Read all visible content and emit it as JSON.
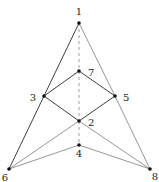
{
  "diagram": {
    "type": "graph",
    "nodes": [
      {
        "id": "1",
        "label": "1",
        "x": 79,
        "y": 23,
        "lx": 79,
        "ly": 15,
        "anchor": "middle"
      },
      {
        "id": "7",
        "label": "7",
        "x": 79,
        "y": 71,
        "lx": 88,
        "ly": 76,
        "anchor": "start"
      },
      {
        "id": "3",
        "label": "3",
        "x": 44,
        "y": 96,
        "lx": 36,
        "ly": 101,
        "anchor": "end"
      },
      {
        "id": "5",
        "label": "5",
        "x": 115,
        "y": 96,
        "lx": 123,
        "ly": 101,
        "anchor": "start"
      },
      {
        "id": "2",
        "label": "2",
        "x": 79,
        "y": 121,
        "lx": 88,
        "ly": 126,
        "anchor": "start"
      },
      {
        "id": "4",
        "label": "4",
        "x": 79,
        "y": 145,
        "lx": 79,
        "ly": 157,
        "anchor": "middle"
      },
      {
        "id": "6",
        "label": "6",
        "x": 9,
        "y": 169,
        "lx": 5,
        "ly": 181,
        "anchor": "middle"
      },
      {
        "id": "8",
        "label": "8",
        "x": 150,
        "y": 169,
        "lx": 155,
        "ly": 180,
        "anchor": "middle"
      }
    ],
    "edges": [
      {
        "from": "1",
        "to": "3",
        "style": "solid"
      },
      {
        "from": "3",
        "to": "6",
        "style": "solid"
      },
      {
        "from": "1",
        "to": "5",
        "style": "light"
      },
      {
        "from": "5",
        "to": "8",
        "style": "light"
      },
      {
        "from": "3",
        "to": "7",
        "style": "solid"
      },
      {
        "from": "7",
        "to": "5",
        "style": "solid"
      },
      {
        "from": "3",
        "to": "2",
        "style": "solid"
      },
      {
        "from": "2",
        "to": "8",
        "style": "light"
      },
      {
        "from": "5",
        "to": "2",
        "style": "solid"
      },
      {
        "from": "2",
        "to": "6",
        "style": "light"
      },
      {
        "from": "6",
        "to": "4",
        "style": "light"
      },
      {
        "from": "4",
        "to": "8",
        "style": "light"
      },
      {
        "from": "1",
        "to": "7",
        "style": "dashed"
      },
      {
        "from": "7",
        "to": "2",
        "style": "dashed"
      },
      {
        "from": "2",
        "to": "4",
        "style": "dashed"
      }
    ]
  }
}
